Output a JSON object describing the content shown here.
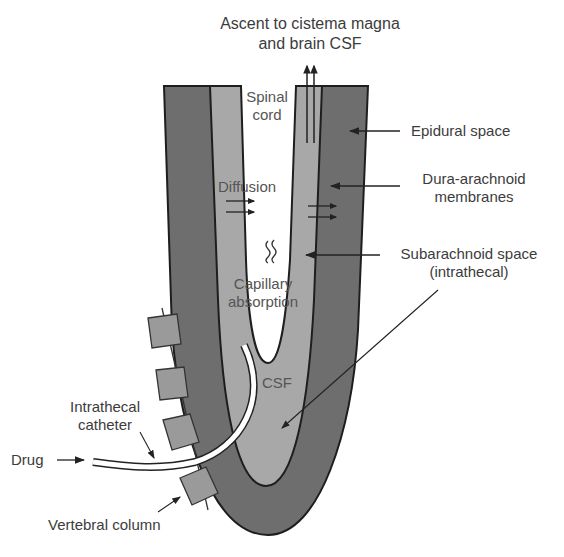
{
  "title": {
    "line1": "Ascent to cistema magna",
    "line2": "and brain CSF"
  },
  "labels": {
    "spinal_cord_1": "Spinal",
    "spinal_cord_2": "cord",
    "diffusion": "Diffusion",
    "capillary_1": "Capillary",
    "capillary_2": "absorption",
    "csf": "CSF",
    "epidural": "Epidural space",
    "dura_1": "Dura-arachnoid",
    "dura_2": "membranes",
    "subarachnoid_1": "Subarachnoid space",
    "subarachnoid_2": "(intrathecal)",
    "catheter_1": "Intrathecal",
    "catheter_2": "catheter",
    "drug": "Drug",
    "vertebral": "Vertebral column"
  },
  "icons": {
    "ascent": "double-up-arrow",
    "diffusion": "right-arrows",
    "capillary": "squiggle-lines"
  },
  "colors": {
    "epidural_dark": "#6e6e6e",
    "subarachnoid_light": "#a8a8a8",
    "vertebra": "#9a9a9a",
    "outline": "#1e1e1e",
    "text": "#3c3c3c"
  }
}
